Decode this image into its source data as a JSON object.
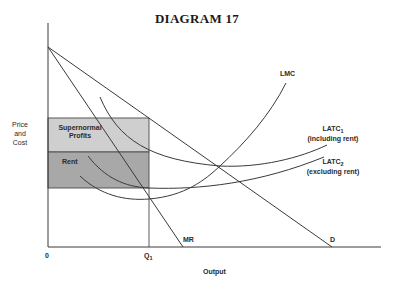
{
  "title": "DIAGRAM 17",
  "axes": {
    "y_label_lines": [
      "Price",
      "and",
      "Cost"
    ],
    "x_label": "Output",
    "origin": "0",
    "q1_label": "Q",
    "q1_sub": "1"
  },
  "regions": {
    "upper": {
      "label_lines": [
        "Supernormal",
        "Profits"
      ],
      "color": "#cfcfcf"
    },
    "lower": {
      "label": "Rent",
      "color": "#a8a8a8"
    }
  },
  "curves": {
    "lmc": "LMC",
    "latc1": {
      "name": "LATC",
      "sub": "1",
      "note": "(including rent)"
    },
    "latc2": {
      "name": "LATC",
      "sub": "2",
      "note": "(excluding rent)"
    },
    "mr": "MR",
    "d": "D"
  },
  "colors": {
    "line": "#3a3a3a",
    "upper_fill": "#cfcfcf",
    "lower_fill": "#a8a8a8"
  }
}
